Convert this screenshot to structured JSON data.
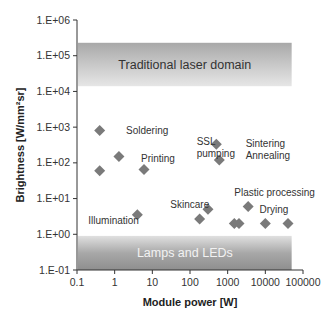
{
  "chart_data": {
    "type": "scatter",
    "title": "",
    "xlabel": "Module power [W]",
    "ylabel": "Brightness [W/mm²sr]",
    "xscale": "log",
    "yscale": "log",
    "xlim": [
      0.1,
      100000
    ],
    "ylim": [
      0.1,
      1000000
    ],
    "x_ticks": [
      "0.1",
      "1",
      "10",
      "100",
      "1000",
      "10000",
      "100000"
    ],
    "y_ticks": [
      "1.E-01",
      "1.E+00",
      "1.E+01",
      "1.E+02",
      "1.E+03",
      "1.E+04",
      "1.E+05",
      "1.E+06"
    ],
    "grid": false,
    "legend": null,
    "marker": "diamond",
    "marker_color": "#7a7a7a",
    "bands": [
      {
        "label": "Traditional laser domain",
        "y_range": [
          14000,
          230000
        ],
        "x_range": [
          0.1,
          50000
        ],
        "label_color": "#333333"
      },
      {
        "label": "Lamps and LEDs",
        "y_range": [
          0.1,
          0.9
        ],
        "x_range": [
          0.1,
          50000
        ],
        "label_color": "#f2f2f2"
      }
    ],
    "points": [
      {
        "x": 0.4,
        "y": 800
      },
      {
        "x": 0.4,
        "y": 60
      },
      {
        "x": 1.3,
        "y": 150
      },
      {
        "x": 6,
        "y": 65
      },
      {
        "x": 4,
        "y": 3.5
      },
      {
        "x": 180,
        "y": 2.7
      },
      {
        "x": 300,
        "y": 5
      },
      {
        "x": 500,
        "y": 330
      },
      {
        "x": 600,
        "y": 120
      },
      {
        "x": 1500,
        "y": 2
      },
      {
        "x": 2000,
        "y": 2
      },
      {
        "x": 3500,
        "y": 6
      },
      {
        "x": 10000,
        "y": 2
      },
      {
        "x": 40000,
        "y": 2
      }
    ],
    "annotations": [
      {
        "text": "Soldering",
        "x": 2,
        "y": 800
      },
      {
        "text": "Printing",
        "x": 5,
        "y": 130
      },
      {
        "text": "SSL",
        "x": 150,
        "y": 400
      },
      {
        "text": "pumping",
        "x": 150,
        "y": 180
      },
      {
        "text": "Sintering",
        "x": 3000,
        "y": 350
      },
      {
        "text": "Annealing",
        "x": 3000,
        "y": 160
      },
      {
        "text": "Plastic processing",
        "x": 1500,
        "y": 15
      },
      {
        "text": "Skincare",
        "x": 30,
        "y": 7
      },
      {
        "text": "Illumination",
        "x": 0.2,
        "y": 2.5
      },
      {
        "text": "Drying",
        "x": 7000,
        "y": 5
      }
    ]
  }
}
